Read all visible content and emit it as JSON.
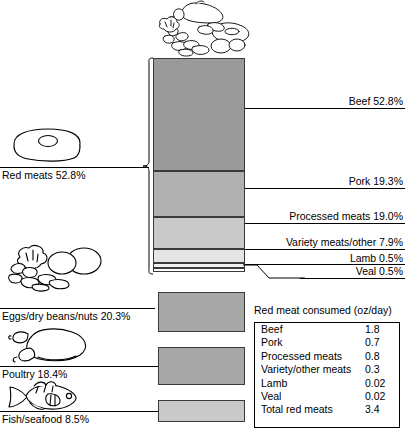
{
  "chart_data": {
    "type": "bar",
    "subtitle": "",
    "xlabel": "",
    "ylabel": "",
    "grid": false,
    "legend_position": "none",
    "units": "percent of total",
    "stacked_bar": {
      "name": "Red meats",
      "total_percent": 52.8,
      "categories": [
        "Beef",
        "Pork",
        "Processed meats",
        "Variety meats/other",
        "Lamb",
        "Veal"
      ],
      "values": [
        52.8,
        19.3,
        19.0,
        7.9,
        0.5,
        0.5
      ],
      "colors": [
        "#9a9a9a",
        "#b0b0b0",
        "#c9c9c9",
        "#e4e4e4",
        "#f0f0f0",
        "#fbfbfb"
      ]
    },
    "categories": [
      "Red meats",
      "Eggs/dry beans/nuts",
      "Poultry",
      "Fish/seafood"
    ],
    "values": [
      52.8,
      20.3,
      18.4,
      8.5
    ],
    "series": [
      {
        "name": "Percent of protein sources",
        "values": [
          52.8,
          20.3,
          18.4,
          8.5
        ]
      }
    ],
    "table": {
      "title": "Red meat consumed (oz/day)",
      "columns": [
        "Meat",
        "oz/day"
      ],
      "rows": [
        [
          "Beef",
          "1.8"
        ],
        [
          "Pork",
          "0.7"
        ],
        [
          "Processed meats",
          "0.8"
        ],
        [
          "Variety/other meats",
          "0.3"
        ],
        [
          "Lamb",
          "0.02"
        ],
        [
          "Veal",
          "0.02"
        ],
        [
          "Total red meats",
          "3.4"
        ]
      ]
    }
  },
  "segments": {
    "beef": {
      "label": "Beef 52.8%",
      "color": "#9a9a9a"
    },
    "pork": {
      "label": "Pork 19.3%",
      "color": "#b0b0b0"
    },
    "processed": {
      "label": "Processed meats 19.0%",
      "color": "#c9c9c9"
    },
    "variety": {
      "label": "Variety meats/other 7.9%",
      "color": "#e4e4e4"
    },
    "lamb": {
      "label": "Lamb 0.5%",
      "color": "#f0f0f0"
    },
    "veal": {
      "label": "Veal 0.5%",
      "color": "#fbfbfb"
    }
  },
  "left_groups": {
    "red_meats": {
      "label": "Red meats 52.8%",
      "icon": "steak-icon",
      "color": "#9a9a9a"
    },
    "eggs": {
      "label": "Eggs/dry beans/nuts 20.3%",
      "icon": "eggs-beans-nuts-icon",
      "color": "#a8a8a8"
    },
    "poultry": {
      "label": "Poultry 18.4%",
      "icon": "poultry-icon",
      "color": "#a8a8a8"
    },
    "fish": {
      "label": "Fish/seafood 8.5%",
      "icon": "fish-icon",
      "color": "#c9c9c9"
    }
  },
  "top_icon": {
    "name": "food-assortment-icon"
  },
  "oz_table": {
    "title": "Red meat consumed (oz/day)",
    "rows": [
      {
        "name": "Beef",
        "value": "1.8"
      },
      {
        "name": "Pork",
        "value": "0.7"
      },
      {
        "name": "Processed meats",
        "value": "0.8"
      },
      {
        "name": "Variety/other meats",
        "value": "0.3"
      },
      {
        "name": "Lamb",
        "value": "0.02"
      },
      {
        "name": "Veal",
        "value": "0.02"
      },
      {
        "name": "Total red meats",
        "value": "3.4"
      }
    ]
  }
}
